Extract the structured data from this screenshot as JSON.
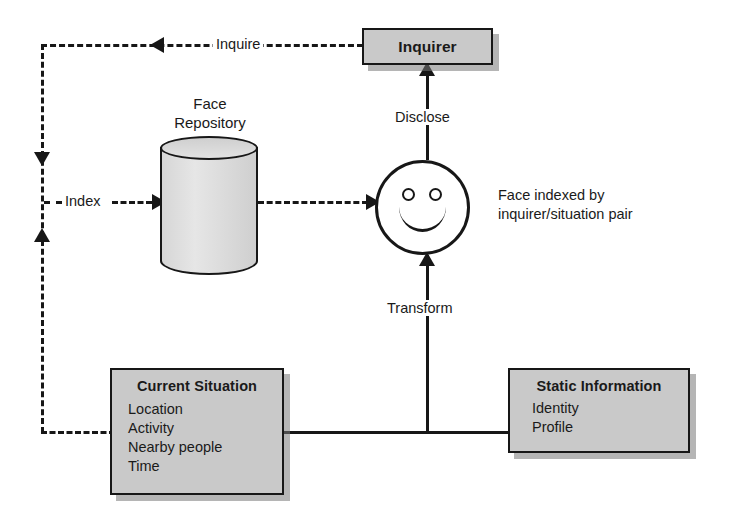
{
  "diagram": {
    "nodes": {
      "inquirer": {
        "title": "Inquirer"
      },
      "repository": {
        "label_line1": "Face",
        "label_line2": "Repository"
      },
      "face": {
        "note_line1": "Face indexed by",
        "note_line2": "inquirer/situation pair"
      },
      "current_situation": {
        "title": "Current Situation",
        "items": [
          "Location",
          "Activity",
          "Nearby people",
          "Time"
        ]
      },
      "static_information": {
        "title": "Static Information",
        "items": [
          "Identity",
          "Profile"
        ]
      }
    },
    "edges": {
      "inquire": "Inquire",
      "index": "Index",
      "disclose": "Disclose",
      "transform": "Transform"
    },
    "colors": {
      "box_fill": "#c9c9c9",
      "stroke": "#171717",
      "cylinder_fill": "#dddddd",
      "background": "#ffffff"
    }
  }
}
